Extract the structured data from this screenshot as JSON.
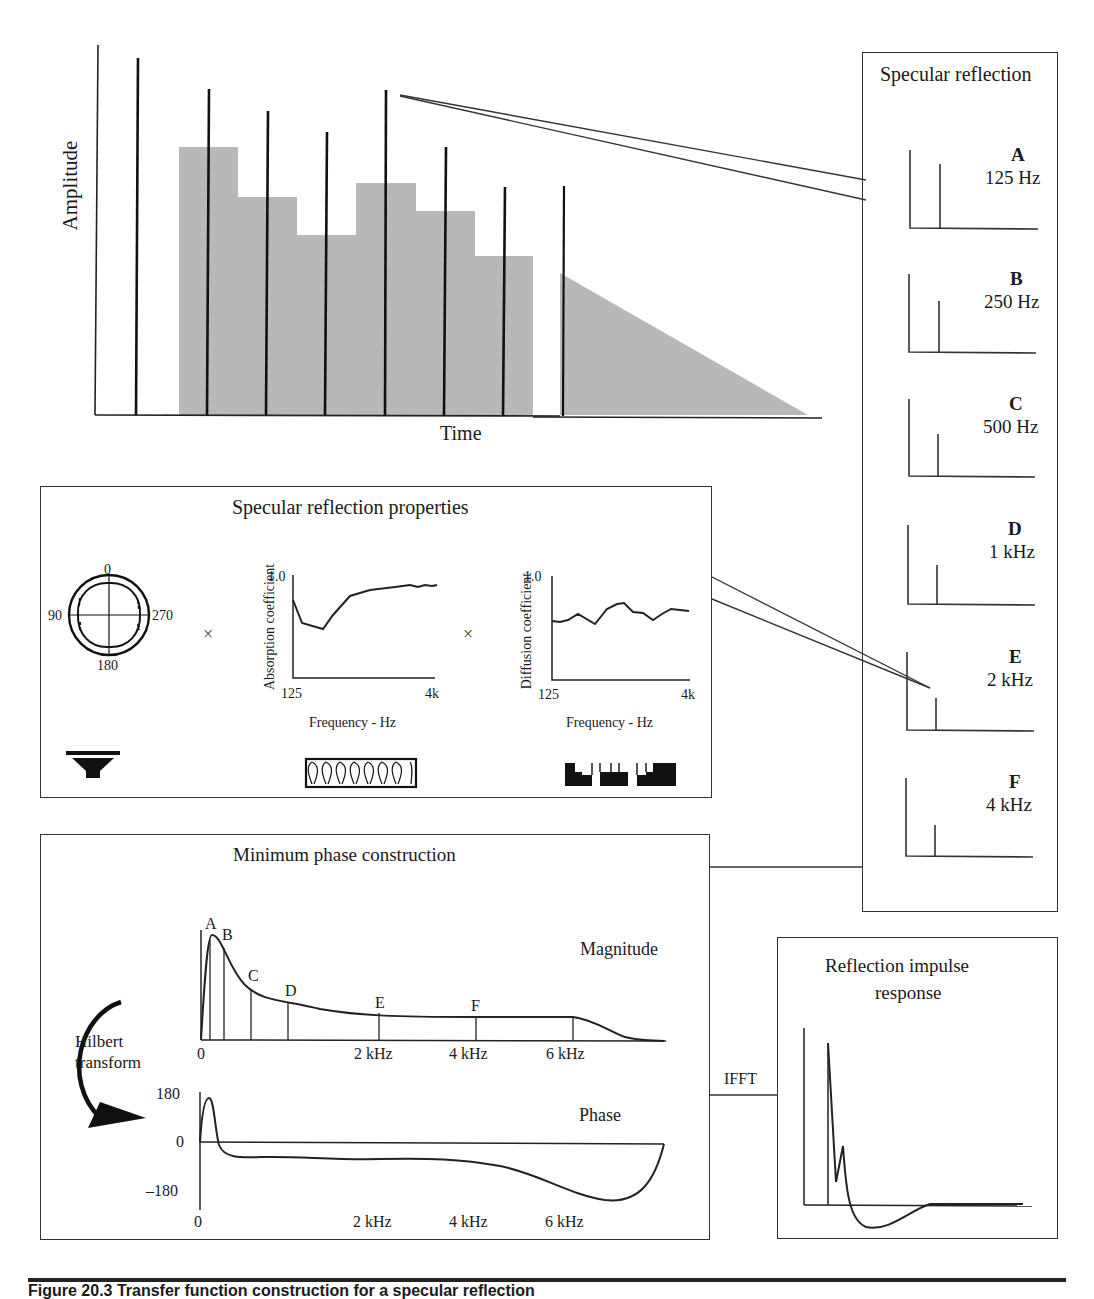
{
  "time_plot": {
    "y_label": "Amplitude",
    "x_label": "Time",
    "impulse_color": "#111111",
    "envelope_color": "#b8b8b8"
  },
  "specular_reflection": {
    "title": "Specular reflection",
    "bands": [
      {
        "letter": "A",
        "freq": "125 Hz"
      },
      {
        "letter": "B",
        "freq": "250 Hz"
      },
      {
        "letter": "C",
        "freq": "500 Hz"
      },
      {
        "letter": "D",
        "freq": "1 kHz"
      },
      {
        "letter": "E",
        "freq": "2 kHz"
      },
      {
        "letter": "F",
        "freq": "4 kHz"
      }
    ]
  },
  "properties": {
    "title": "Specular reflection properties",
    "polar": {
      "top": "0",
      "left": "90",
      "right": "270",
      "bottom": "180"
    },
    "multiply_symbol": "×",
    "absorption": {
      "y_label": "Absorption coefficient",
      "y_max": "1.0",
      "x_min": "125",
      "x_max": "4k",
      "x_label": "Frequency - Hz"
    },
    "diffusion": {
      "y_label": "Diffusion coefficient",
      "y_max": "1.0",
      "x_min": "125",
      "x_max": "4k",
      "x_label": "Frequency - Hz"
    },
    "icons": [
      "loudspeaker-icon",
      "absorber-panel-icon",
      "diffuser-panel-icon"
    ]
  },
  "min_phase": {
    "title": "Minimum phase construction",
    "magnitude_label": "Magnitude",
    "phase_label": "Phase",
    "hilbert_label_1": "Hilbert",
    "hilbert_label_2": "transform",
    "markers": [
      "A",
      "B",
      "C",
      "D",
      "E",
      "F"
    ],
    "mag_ticks": [
      "0",
      "2 kHz",
      "4 kHz",
      "6 kHz"
    ],
    "phase_ticks": [
      "0",
      "2 kHz",
      "4 kHz",
      "6 kHz"
    ],
    "phase_y": [
      "180",
      "0",
      "–180"
    ]
  },
  "ifft_label": "IFFT",
  "impulse_response": {
    "title_1": "Reflection impulse",
    "title_2": "response"
  },
  "caption": "Figure 20.3  Transfer function construction for a specular reflection"
}
